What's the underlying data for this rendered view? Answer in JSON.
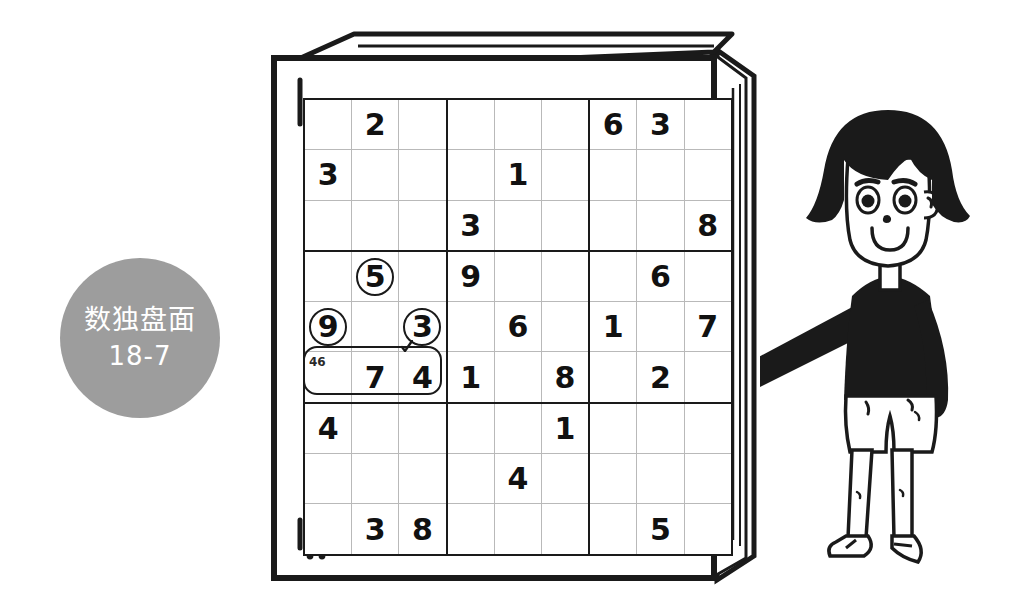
{
  "badge": {
    "title": "数独盘面",
    "subtitle": "18-7",
    "color": "#9d9d9d",
    "text_color": "#ffffff"
  },
  "book": {
    "name": "sudoku-book",
    "cover_color": "#ffffff",
    "outline_color": "#1a1a1a"
  },
  "colors": {
    "grid_line_thin": "#b9b9b9",
    "grid_line_thick": "#1a1a1a",
    "highlight_light": "#a8a8a8",
    "highlight_dark": "#6e6e6e",
    "digit": "#111111",
    "background": "#ffffff"
  },
  "annotation": {
    "pencil_mark": "46",
    "pencil_cell": "r6c1",
    "selection_label": "row6-cells-1-3"
  },
  "chart_data": {
    "type": "table",
    "title": "数独盘面 18-7",
    "rows": 9,
    "cols": 9,
    "grid": [
      [
        "",
        "2",
        "",
        "",
        "",
        "",
        "6",
        "3",
        ""
      ],
      [
        "3",
        "",
        "",
        "",
        "1",
        "",
        "",
        "",
        ""
      ],
      [
        "",
        "",
        "",
        "3",
        "",
        "",
        "",
        "",
        "8"
      ],
      [
        "",
        "5",
        "",
        "9",
        "",
        "",
        "",
        "6",
        ""
      ],
      [
        "9",
        "",
        "3",
        "",
        "6",
        "",
        "1",
        "",
        "7"
      ],
      [
        "",
        "7",
        "4",
        "1",
        "",
        "8",
        "",
        "2",
        ""
      ],
      [
        "4",
        "",
        "",
        "",
        "",
        "1",
        "",
        "",
        ""
      ],
      [
        "",
        "",
        "",
        "",
        "4",
        "",
        "",
        "",
        ""
      ],
      [
        "",
        "3",
        "8",
        "",
        "",
        "",
        "",
        "5",
        ""
      ]
    ],
    "circled_cells": [
      "r4c2",
      "r5c1",
      "r5c3"
    ],
    "light_highlight_cells": [
      "r4c1",
      "r4c2",
      "r4c3",
      "r5c1",
      "r5c2",
      "r5c3"
    ],
    "dark_highlight_cells": [
      "r6c1",
      "r6c2",
      "r6c3",
      "r6c4",
      "r6c5",
      "r6c6",
      "r6c7",
      "r6c8",
      "r6c9"
    ]
  },
  "character": {
    "name": "cartoon-girl",
    "hair_color": "#1a1a1a",
    "shirt_color": "#1a1a1a",
    "skin_color": "#ffffff"
  }
}
